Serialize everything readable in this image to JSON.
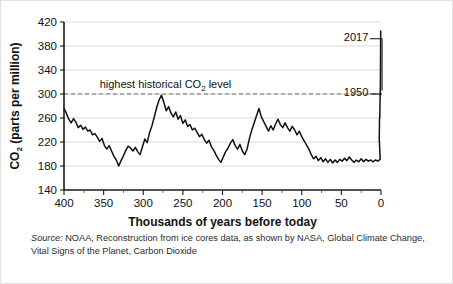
{
  "chart_data": {
    "type": "line",
    "title": "",
    "xlabel": "Thousands of years before today",
    "ylabel_main": "CO",
    "ylabel_sub": "2",
    "ylabel_rest": " (parts per million)",
    "ylabel_full": "CO2 (parts per million)",
    "xlim": [
      400,
      0
    ],
    "ylim": [
      140,
      420
    ],
    "x_ticks": [
      400,
      350,
      300,
      250,
      200,
      150,
      100,
      50,
      0
    ],
    "x_minor_ticks": [
      375,
      325,
      275,
      225,
      175,
      125,
      75,
      25
    ],
    "y_ticks": [
      140,
      180,
      220,
      260,
      300,
      340,
      380,
      420
    ],
    "grid": "horizontal",
    "legend": "none",
    "x_axis_direction": "reversed",
    "threshold": {
      "value": 300,
      "label_main": "highest historical CO",
      "label_sub": "2",
      "label_rest": " level",
      "label_full": "highest historical CO2 level",
      "style": "dashed"
    },
    "annotations": [
      {
        "label": "2017",
        "value": 405,
        "x_kya": 0,
        "leader": "right-edge-top"
      },
      {
        "label": "1950",
        "value": 310,
        "x_kya": 0,
        "leader": "right-edge-mid"
      }
    ],
    "series": [
      {
        "name": "CO2 from ice cores",
        "points": [
          [
            400,
            276
          ],
          [
            397,
            268
          ],
          [
            394,
            258
          ],
          [
            391,
            252
          ],
          [
            388,
            259
          ],
          [
            385,
            253
          ],
          [
            382,
            244
          ],
          [
            379,
            248
          ],
          [
            376,
            241
          ],
          [
            373,
            245
          ],
          [
            370,
            238
          ],
          [
            367,
            240
          ],
          [
            364,
            232
          ],
          [
            361,
            234
          ],
          [
            358,
            228
          ],
          [
            355,
            221
          ],
          [
            352,
            226
          ],
          [
            349,
            214
          ],
          [
            346,
            208
          ],
          [
            343,
            214
          ],
          [
            340,
            205
          ],
          [
            337,
            196
          ],
          [
            334,
            190
          ],
          [
            331,
            180
          ],
          [
            328,
            189
          ],
          [
            325,
            197
          ],
          [
            322,
            206
          ],
          [
            319,
            213
          ],
          [
            316,
            210
          ],
          [
            313,
            205
          ],
          [
            310,
            211
          ],
          [
            307,
            204
          ],
          [
            304,
            199
          ],
          [
            301,
            212
          ],
          [
            298,
            225
          ],
          [
            295,
            219
          ],
          [
            292,
            236
          ],
          [
            289,
            247
          ],
          [
            286,
            262
          ],
          [
            283,
            278
          ],
          [
            280,
            290
          ],
          [
            277,
            298
          ],
          [
            274,
            286
          ],
          [
            271,
            272
          ],
          [
            268,
            279
          ],
          [
            265,
            268
          ],
          [
            262,
            262
          ],
          [
            259,
            270
          ],
          [
            256,
            258
          ],
          [
            253,
            264
          ],
          [
            250,
            251
          ],
          [
            247,
            257
          ],
          [
            244,
            246
          ],
          [
            241,
            249
          ],
          [
            238,
            240
          ],
          [
            235,
            243
          ],
          [
            232,
            236
          ],
          [
            229,
            229
          ],
          [
            226,
            233
          ],
          [
            223,
            224
          ],
          [
            220,
            218
          ],
          [
            217,
            223
          ],
          [
            214,
            212
          ],
          [
            211,
            206
          ],
          [
            208,
            198
          ],
          [
            205,
            191
          ],
          [
            202,
            186
          ],
          [
            199,
            195
          ],
          [
            196,
            204
          ],
          [
            193,
            210
          ],
          [
            190,
            218
          ],
          [
            187,
            224
          ],
          [
            184,
            214
          ],
          [
            181,
            208
          ],
          [
            178,
            216
          ],
          [
            175,
            205
          ],
          [
            172,
            199
          ],
          [
            169,
            208
          ],
          [
            166,
            226
          ],
          [
            163,
            240
          ],
          [
            160,
            252
          ],
          [
            157,
            264
          ],
          [
            154,
            276
          ],
          [
            151,
            262
          ],
          [
            148,
            254
          ],
          [
            145,
            246
          ],
          [
            142,
            238
          ],
          [
            139,
            247
          ],
          [
            136,
            240
          ],
          [
            133,
            250
          ],
          [
            130,
            258
          ],
          [
            127,
            249
          ],
          [
            124,
            244
          ],
          [
            121,
            252
          ],
          [
            118,
            244
          ],
          [
            115,
            238
          ],
          [
            112,
            246
          ],
          [
            109,
            240
          ],
          [
            106,
            232
          ],
          [
            103,
            238
          ],
          [
            100,
            229
          ],
          [
            97,
            222
          ],
          [
            94,
            215
          ],
          [
            91,
            208
          ],
          [
            88,
            199
          ],
          [
            85,
            192
          ],
          [
            82,
            196
          ],
          [
            79,
            189
          ],
          [
            76,
            194
          ],
          [
            73,
            187
          ],
          [
            70,
            192
          ],
          [
            67,
            186
          ],
          [
            64,
            191
          ],
          [
            61,
            185
          ],
          [
            58,
            190
          ],
          [
            55,
            186
          ],
          [
            52,
            191
          ],
          [
            49,
            188
          ],
          [
            46,
            193
          ],
          [
            43,
            189
          ],
          [
            40,
            195
          ],
          [
            37,
            190
          ],
          [
            34,
            186
          ],
          [
            31,
            190
          ],
          [
            28,
            187
          ],
          [
            25,
            192
          ],
          [
            22,
            187
          ],
          [
            19,
            191
          ],
          [
            16,
            188
          ],
          [
            13,
            190
          ],
          [
            10,
            187
          ],
          [
            7,
            190
          ],
          [
            4,
            188
          ],
          [
            1,
            191
          ]
        ]
      }
    ]
  },
  "source": {
    "label": "Source:",
    "text": " NOAA, Reconstruction from ice cores data, as shown by NASA, Global Climate Change, Vital Signs of the Planet, Carbon Dioxide"
  },
  "colors": {
    "line": "#111111",
    "grid": "#cfcfcf",
    "axis": "#1a1a1a",
    "threshold": "#6e6e6e",
    "text": "#111111",
    "card_border": "#e2e2e2"
  }
}
